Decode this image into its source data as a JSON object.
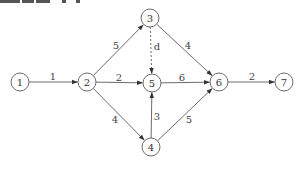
{
  "diagram": {
    "type": "network-graph",
    "clipped_header_text": true,
    "colors": {
      "stroke": "#6b6b6b",
      "text": "#333333",
      "background": "#ffffff"
    },
    "node_radius": 9,
    "nodes": [
      {
        "id": "1",
        "label": "1",
        "x": 20,
        "y": 82
      },
      {
        "id": "2",
        "label": "2",
        "x": 87,
        "y": 82
      },
      {
        "id": "3",
        "label": "3",
        "x": 150,
        "y": 18
      },
      {
        "id": "4",
        "label": "4",
        "x": 151,
        "y": 147
      },
      {
        "id": "5",
        "label": "5",
        "x": 152,
        "y": 83
      },
      {
        "id": "6",
        "label": "6",
        "x": 219,
        "y": 82
      },
      {
        "id": "7",
        "label": "7",
        "x": 284,
        "y": 82
      }
    ],
    "edges": [
      {
        "from": "1",
        "to": "2",
        "label": "1",
        "dashed": false,
        "lx": 53,
        "ly": 76
      },
      {
        "from": "2",
        "to": "3",
        "label": "5",
        "dashed": false,
        "lx": 116,
        "ly": 45
      },
      {
        "from": "2",
        "to": "5",
        "label": "2",
        "dashed": false,
        "lx": 119,
        "ly": 77
      },
      {
        "from": "2",
        "to": "4",
        "label": "4",
        "dashed": false,
        "lx": 115,
        "ly": 119
      },
      {
        "from": "3",
        "to": "5",
        "label": "d",
        "dashed": true,
        "lx": 157,
        "ly": 46
      },
      {
        "from": "3",
        "to": "6",
        "label": "4",
        "dashed": false,
        "lx": 188,
        "ly": 45
      },
      {
        "from": "5",
        "to": "6",
        "label": "6",
        "dashed": false,
        "lx": 182,
        "ly": 77
      },
      {
        "from": "4",
        "to": "5",
        "label": "3",
        "dashed": false,
        "lx": 157,
        "ly": 116
      },
      {
        "from": "4",
        "to": "6",
        "label": "5",
        "dashed": false,
        "lx": 189,
        "ly": 119
      },
      {
        "from": "6",
        "to": "7",
        "label": "2",
        "dashed": false,
        "lx": 252,
        "ly": 76
      }
    ]
  }
}
